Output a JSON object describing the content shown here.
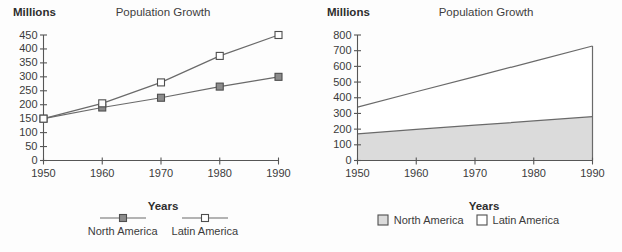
{
  "page": {
    "background": "#fdfdfd",
    "width": 622,
    "height": 252
  },
  "chart_data": [
    {
      "id": "population-growth-line-chart",
      "type": "line",
      "title": "Population Growth",
      "y_unit_label": "Millions",
      "xlabel": "Years",
      "ylabel": "",
      "categories": [
        "1950",
        "1960",
        "1970",
        "1980",
        "1990"
      ],
      "ylim": [
        0,
        450
      ],
      "ytick_step": 50,
      "grid": false,
      "legend_position": "bottom",
      "line_color": "#6a6a6a",
      "series": [
        {
          "name": "North America",
          "marker": "filled-square",
          "color": "#8c8c8c",
          "values": [
            150,
            190,
            225,
            265,
            300
          ]
        },
        {
          "name": "Latin America",
          "marker": "open-square",
          "color": "#ffffff",
          "values": [
            150,
            205,
            280,
            375,
            450
          ]
        }
      ]
    },
    {
      "id": "population-growth-stacked-area-chart",
      "type": "area",
      "title": "Population Growth",
      "y_unit_label": "Millions",
      "xlabel": "Years",
      "ylabel": "",
      "categories": [
        "1950",
        "1960",
        "1970",
        "1980",
        "1990"
      ],
      "ylim": [
        0,
        800
      ],
      "ytick_step": 100,
      "grid": false,
      "stacked": true,
      "legend_position": "bottom",
      "line_color": "#6a6a6a",
      "series": [
        {
          "name": "North America",
          "color": "#dbdbdb",
          "values": [
            170,
            198,
            225,
            252,
            280
          ]
        },
        {
          "name": "Latin America",
          "color": "#ffffff",
          "values": [
            170,
            240,
            310,
            380,
            450
          ]
        }
      ],
      "stacked_totals": [
        340,
        438,
        535,
        632,
        730
      ]
    }
  ]
}
